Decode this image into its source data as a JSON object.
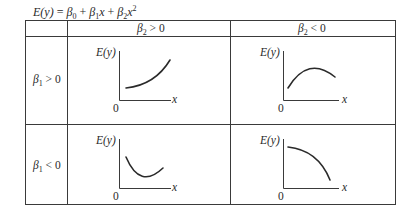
{
  "formula": {
    "lhs": "E(y)",
    "eq": " = ",
    "b0": "β",
    "b0_sub": "0",
    "plus1": " + ",
    "b1": "β",
    "b1_sub": "1",
    "b1_var": "x",
    "plus2": " + ",
    "b2": "β",
    "b2_sub": "2",
    "b2_var": "x",
    "b2_pow": "2"
  },
  "table": {
    "column_headers": [
      {
        "beta": "β",
        "sub": "2",
        "rel": " > 0"
      },
      {
        "beta": "β",
        "sub": "2",
        "rel": " < 0"
      }
    ],
    "row_headers": [
      {
        "beta": "β",
        "sub": "1",
        "rel": " > 0"
      },
      {
        "beta": "β",
        "sub": "1",
        "rel": " < 0"
      }
    ],
    "plot_labels": {
      "y_axis": "E(y)",
      "x_axis": "x",
      "origin": "0"
    },
    "cells": [
      {
        "row": 0,
        "col": 0,
        "shape": "increasing, convex (accelerating upward)"
      },
      {
        "row": 0,
        "col": 1,
        "shape": "concave, rises to a peak then declines"
      },
      {
        "row": 1,
        "col": 0,
        "shape": "convex, falls to a minimum then rises"
      },
      {
        "row": 1,
        "col": 1,
        "shape": "decreasing, concave (accelerating downward)"
      }
    ]
  },
  "colors": {
    "line": "#3a3a3a",
    "curve": "#2a2a2a",
    "text": "#2a2a2a"
  }
}
